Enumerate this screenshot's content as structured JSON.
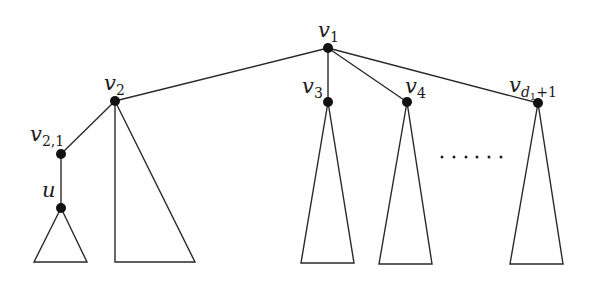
{
  "diagram": {
    "type": "tree",
    "nodes": [
      {
        "id": "v1",
        "base": "v",
        "sub": "1",
        "x": 328,
        "y": 48
      },
      {
        "id": "v2",
        "base": "v",
        "sub": "2",
        "x": 115,
        "y": 101
      },
      {
        "id": "v2_1",
        "base": "v",
        "sub": "2,1",
        "x": 61,
        "y": 154
      },
      {
        "id": "u",
        "base": "u",
        "sub": "",
        "x": 61,
        "y": 208
      },
      {
        "id": "v3",
        "base": "v",
        "sub": "3",
        "x": 328,
        "y": 102
      },
      {
        "id": "v4",
        "base": "v",
        "sub": "4",
        "x": 407,
        "y": 102
      },
      {
        "id": "vd1p1",
        "base": "v",
        "sub_var": "d",
        "sub_var_sub": "1",
        "sub_tail": "+1",
        "x": 538,
        "y": 103
      }
    ],
    "edges": [
      [
        "v1",
        "v2"
      ],
      [
        "v1",
        "v3"
      ],
      [
        "v1",
        "v4"
      ],
      [
        "v1",
        "vd1p1"
      ],
      [
        "v2",
        "v2_1"
      ],
      [
        "v2_1",
        "u"
      ]
    ],
    "subtrees": [
      {
        "root": "u",
        "shape": "triangle",
        "base_left": 34,
        "base_right": 87,
        "base_y": 262
      },
      {
        "root": "v2",
        "shape": "right-triangle",
        "base_left": 115,
        "base_right": 195,
        "base_y": 262
      },
      {
        "root": "v3",
        "shape": "triangle",
        "base_left": 301,
        "base_right": 354,
        "base_y": 263
      },
      {
        "root": "v4",
        "shape": "triangle",
        "base_left": 379,
        "base_right": 432,
        "base_y": 264
      },
      {
        "root": "vd1p1",
        "shape": "triangle",
        "base_left": 510,
        "base_right": 563,
        "base_y": 264
      }
    ],
    "ellipsis": {
      "text": "......",
      "count": 6,
      "x_start": 442,
      "x_end": 501,
      "y": 157
    },
    "labels": {
      "v1": {
        "base": "v",
        "sub": "1"
      },
      "v2": {
        "base": "v",
        "sub": "2"
      },
      "v2_1": {
        "base": "v",
        "sub": "2,1"
      },
      "u": {
        "base": "u"
      },
      "v3": {
        "base": "v",
        "sub": "3"
      },
      "v4": {
        "base": "v",
        "sub": "4"
      },
      "vd1p1": {
        "base": "v",
        "sub_d": "d",
        "sub_d_sub": "1",
        "sub_tail": "+1"
      }
    },
    "colors": {
      "line": "#2a2a2a",
      "node": "#111111",
      "background": "#ffffff"
    }
  }
}
